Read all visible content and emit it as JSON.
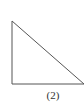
{
  "figure": {
    "label": "(2)",
    "shape": "right-triangle",
    "stroke_color": "#555555",
    "background": "#ffffff",
    "vertices": [
      [
        12,
        21
      ],
      [
        12,
        84
      ],
      [
        84,
        84
      ]
    ]
  }
}
